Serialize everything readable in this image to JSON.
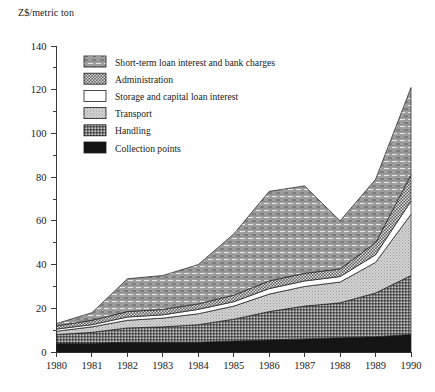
{
  "chart_data": {
    "type": "area",
    "stacked": true,
    "title": "",
    "subtitle": "",
    "ylabel": "Z$/metric ton",
    "xlabel": "",
    "x": [
      1980,
      1981,
      1982,
      1983,
      1984,
      1985,
      1986,
      1987,
      1988,
      1989,
      1990
    ],
    "xtick_labels": [
      "1980",
      "1981",
      "1982",
      "1983",
      "1984",
      "1985",
      "1986",
      "1987",
      "1988",
      "1989",
      "1990"
    ],
    "ytick_labels": [
      "0",
      "20",
      "40",
      "60",
      "80",
      "100",
      "120",
      "140"
    ],
    "ytick_values": [
      0,
      20,
      40,
      60,
      80,
      100,
      120,
      140
    ],
    "yminor_step": 10,
    "ylim": [
      0,
      140
    ],
    "xlim": [
      1980,
      1990
    ],
    "grid": false,
    "legend_position": "upper-left-inside",
    "series": [
      {
        "name": "Collection points",
        "pattern": "solid-black",
        "color": "#1a1a1a",
        "values": [
          4.0,
          4.0,
          4.5,
          4.5,
          4.5,
          5.0,
          5.5,
          6.0,
          6.5,
          7.0,
          8.0
        ]
      },
      {
        "name": "Handling",
        "pattern": "dense-checker",
        "color": "#6e6e6e",
        "values": [
          4.0,
          5.0,
          6.5,
          7.0,
          8.0,
          10.0,
          13.0,
          15.0,
          16.0,
          20.0,
          27.0
        ]
      },
      {
        "name": "Transport",
        "pattern": "light-stipple",
        "color": "#c2c2c2",
        "values": [
          1.5,
          2.5,
          3.5,
          4.0,
          5.0,
          6.0,
          8.0,
          9.0,
          9.5,
          14.0,
          28.0
        ]
      },
      {
        "name": "Storage and capital loan interest",
        "pattern": "white",
        "color": "#ffffff",
        "values": [
          1.0,
          1.0,
          1.5,
          1.5,
          2.0,
          2.0,
          2.5,
          2.5,
          2.5,
          3.5,
          6.0
        ]
      },
      {
        "name": "Administration",
        "pattern": "fine-checker",
        "color": "#4f4f4f",
        "values": [
          1.5,
          2.0,
          2.5,
          2.5,
          2.5,
          3.0,
          3.5,
          3.5,
          3.5,
          5.5,
          12.0
        ]
      },
      {
        "name": "Short-term loan interest and bank charges",
        "pattern": "hatched-grey",
        "color": "#9a9a9a",
        "values": [
          1.0,
          3.5,
          15.0,
          15.5,
          18.0,
          28.0,
          41.0,
          40.0,
          22.0,
          29.0,
          40.0
        ]
      }
    ],
    "totals": [
      13.0,
      18.0,
      33.5,
      35.0,
      40.0,
      54.0,
      73.5,
      76.0,
      60.0,
      79.0,
      121.0
    ],
    "legend_entries": [
      "Short-term loan interest and bank charges",
      "Administration",
      "Storage and capital loan interest",
      "Transport",
      "Handling",
      "Collection points"
    ]
  }
}
